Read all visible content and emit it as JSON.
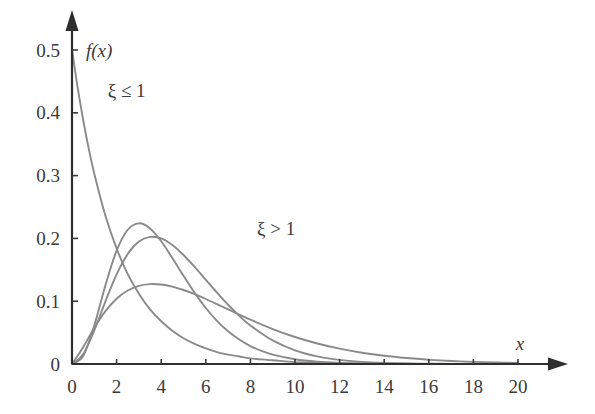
{
  "chart_data": {
    "type": "line",
    "title": "",
    "subtitle": "",
    "xlabel": "x",
    "ylabel": "f(x)",
    "xlim": [
      0,
      20
    ],
    "ylim": [
      0,
      0.5
    ],
    "grid": false,
    "legend_position": "none",
    "x_ticks": [
      "0",
      "2",
      "4",
      "6",
      "8",
      "10",
      "12",
      "14",
      "16",
      "18",
      "20"
    ],
    "x_tick_values": [
      0,
      2,
      4,
      6,
      8,
      10,
      12,
      14,
      16,
      18,
      20
    ],
    "y_ticks": [
      "0",
      "0.1",
      "0.2",
      "0.3",
      "0.4",
      "0.5"
    ],
    "y_tick_values": [
      0,
      0.1,
      0.2,
      0.3,
      0.4,
      0.5
    ],
    "annotations": [
      {
        "text": "ξ ≤ 1",
        "x": 1.6,
        "y": 0.425,
        "name": "xi-le-1-label"
      },
      {
        "text": "ξ > 1",
        "x": 8.3,
        "y": 0.205,
        "name": "xi-gt-1-label"
      }
    ],
    "axis_labels": {
      "y_axis_name": "f(x)",
      "x_axis_name": "x"
    },
    "curve_color": "#8a8a8a",
    "axis_color": "#2e2e2e",
    "series": [
      {
        "name": "xi <= 1 (exponential decay)",
        "shape_family": "gamma",
        "k": 1.0,
        "theta": 2.0,
        "peak_x": 0.0,
        "peak_y": 0.5,
        "x": [
          0,
          0.25,
          0.5,
          0.75,
          1,
          1.5,
          2,
          2.5,
          3,
          3.5,
          4,
          4.5,
          5,
          5.5,
          6,
          6.5,
          7,
          7.5,
          8,
          9,
          10,
          11,
          12,
          13,
          14,
          15,
          16,
          17,
          18,
          19,
          20
        ],
        "values": [
          0.5,
          0.441,
          0.389,
          0.343,
          0.303,
          0.236,
          0.184,
          0.143,
          0.112,
          0.087,
          0.068,
          0.053,
          0.041,
          0.032,
          0.025,
          0.019,
          0.015,
          0.012,
          0.009,
          0.006,
          0.003,
          0.002,
          0.001,
          0.001,
          0.0005,
          0.0003,
          0.0002,
          0.0001,
          0.0001,
          5e-05,
          2e-05
        ]
      },
      {
        "name": "xi > 1 (tall peak)",
        "shape_family": "gamma",
        "k": 4.0,
        "theta": 1.0,
        "peak_x": 4.0,
        "peak_y": 0.277,
        "x": [
          0,
          0.5,
          1,
          1.5,
          2,
          2.5,
          3,
          3.5,
          4,
          4.5,
          5,
          5.5,
          6,
          6.5,
          7,
          7.5,
          8,
          8.5,
          9,
          10,
          11,
          12,
          13,
          14,
          15,
          16,
          17,
          18,
          19,
          20
        ],
        "values": [
          0,
          0.0126,
          0.0613,
          0.1255,
          0.1804,
          0.2138,
          0.224,
          0.2158,
          0.1954,
          0.1687,
          0.1404,
          0.1133,
          0.0892,
          0.0688,
          0.0521,
          0.0389,
          0.0286,
          0.0208,
          0.015,
          0.0076,
          0.0037,
          0.0018,
          0.0008,
          0.0004,
          0.0002,
          0.0001,
          4e-05,
          2e-05,
          1e-05,
          4e-06
        ]
      },
      {
        "name": "xi > 1 (medium peak)",
        "shape_family": "gamma",
        "k": 3.0,
        "theta": 1.4,
        "peak_x": 4.0,
        "peak_y": 0.195,
        "x": [
          0,
          0.5,
          1,
          1.5,
          2,
          2.5,
          3,
          3.5,
          4,
          4.5,
          5,
          5.5,
          6,
          6.5,
          7,
          7.5,
          8,
          9,
          10,
          11,
          12,
          13,
          14,
          15,
          16,
          17,
          18,
          19,
          20
        ],
        "values": [
          0,
          0.0155,
          0.0536,
          0.0998,
          0.1427,
          0.1752,
          0.1949,
          0.2025,
          0.1999,
          0.1895,
          0.1736,
          0.1546,
          0.1341,
          0.1136,
          0.0943,
          0.0767,
          0.0614,
          0.0376,
          0.0218,
          0.0121,
          0.0065,
          0.0034,
          0.0017,
          0.0009,
          0.0004,
          0.0002,
          0.0001,
          5e-05,
          2e-05
        ]
      },
      {
        "name": "xi > 1 (broad low peak)",
        "shape_family": "gamma",
        "k": 2.2,
        "theta": 2.4,
        "peak_x": 4.0,
        "peak_y": 0.135,
        "x": [
          0,
          0.5,
          1,
          1.5,
          2,
          2.5,
          3,
          3.5,
          4,
          4.5,
          5,
          5.5,
          6,
          6.5,
          7,
          7.5,
          8,
          9,
          10,
          11,
          12,
          13,
          14,
          15,
          16,
          17,
          18,
          19,
          20
        ],
        "values": [
          0,
          0.0268,
          0.0576,
          0.0841,
          0.1039,
          0.117,
          0.1244,
          0.1272,
          0.1265,
          0.1231,
          0.1178,
          0.1111,
          0.1035,
          0.0954,
          0.0871,
          0.0788,
          0.0707,
          0.0557,
          0.043,
          0.0326,
          0.0244,
          0.018,
          0.0131,
          0.0095,
          0.0068,
          0.0048,
          0.0034,
          0.0024,
          0.0017
        ]
      }
    ]
  },
  "figure": {
    "background_color": "#ffffff",
    "origin_label": "0"
  }
}
